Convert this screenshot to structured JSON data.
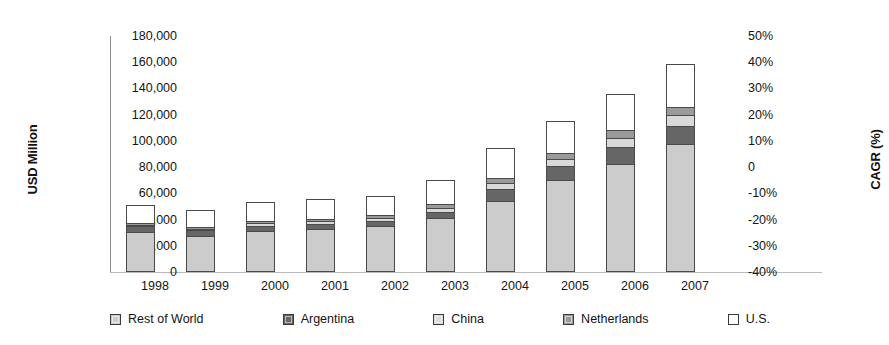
{
  "chart_data": {
    "type": "bar",
    "subtype": "stacked-column",
    "title": "",
    "subtitle": "",
    "xlabel": "",
    "ylabel": "USD Million",
    "ylabel_secondary": "CAGR (%)",
    "grid": false,
    "legend_position": "bottom",
    "categories": [
      "1998",
      "1999",
      "2000",
      "2001",
      "2002",
      "2003",
      "2004",
      "2005",
      "2006",
      "2007"
    ],
    "ylim": [
      0,
      180000
    ],
    "yticks": [
      0,
      20000,
      40000,
      60000,
      80000,
      100000,
      120000,
      140000,
      160000,
      180000
    ],
    "ytick_labels": [
      "0",
      "20,000",
      "40,000",
      "60,000",
      "80,000",
      "100,000",
      "120,000",
      "140,000",
      "160,000",
      "180,000"
    ],
    "ylim_secondary": [
      -40,
      50
    ],
    "yticks_secondary": [
      -40,
      -30,
      -20,
      -10,
      0,
      10,
      20,
      30,
      40,
      50
    ],
    "ytick_labels_secondary": [
      "-40%",
      "-30%",
      "-20%",
      "-10%",
      "0",
      "10%",
      "20%",
      "30%",
      "40%",
      "50%"
    ],
    "stack_order_bottom_to_top": [
      "Rest of World",
      "Argentina",
      "China",
      "Netherlands",
      "U.S."
    ],
    "series": [
      {
        "name": "Rest of World",
        "color": "#cccccc",
        "values": [
          31000,
          27500,
          31500,
          33000,
          35500,
          41000,
          54500,
          70000,
          82500,
          97500
        ]
      },
      {
        "name": "Argentina",
        "color": "#666666",
        "values": [
          4000,
          4500,
          4000,
          4000,
          4000,
          5000,
          9000,
          11000,
          13500,
          14500
        ]
      },
      {
        "name": "China",
        "color": "#d9d9d9",
        "values": [
          1500,
          1500,
          2000,
          2000,
          2000,
          3000,
          4500,
          5500,
          6500,
          8000
        ]
      },
      {
        "name": "Netherlands",
        "color": "#9a9a9a",
        "values": [
          1500,
          1500,
          2000,
          2000,
          2000,
          3000,
          4000,
          5000,
          6000,
          6500
        ]
      },
      {
        "name": "U.S.",
        "color": "#ffffff",
        "values": [
          13000,
          12000,
          14000,
          14500,
          14500,
          18000,
          22500,
          24000,
          27000,
          32000
        ]
      }
    ],
    "totals": [
      51000,
      47000,
      53500,
      55500,
      58000,
      70000,
      94500,
      115500,
      135500,
      158500
    ]
  },
  "axes": {
    "left_title": "USD Million",
    "right_title": "CAGR (%)"
  },
  "legend": {
    "items": [
      {
        "label": "Rest of World",
        "color": "#cccccc",
        "icon": "legend-swatch-rest-of-world"
      },
      {
        "label": "Argentina",
        "color": "#666666",
        "icon": "legend-swatch-argentina"
      },
      {
        "label": "China",
        "color": "#d9d9d9",
        "icon": "legend-swatch-china"
      },
      {
        "label": "Netherlands",
        "color": "#9a9a9a",
        "icon": "legend-swatch-netherlands"
      },
      {
        "label": "U.S.",
        "color": "#ffffff",
        "icon": "legend-swatch-us"
      }
    ]
  }
}
